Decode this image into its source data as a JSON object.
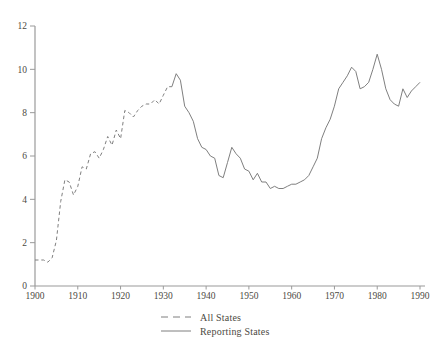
{
  "window": {
    "width": 444,
    "height": 350,
    "background": "#ffffff"
  },
  "colors": {
    "series_line": "#7f7f7f",
    "axis_line": "#9a9a9a",
    "tick_text": "#4c4a43"
  },
  "legend": {
    "position": "bottom-center",
    "items": [
      {
        "label": "All States",
        "line_style": "dashed"
      },
      {
        "label": "Reporting States",
        "line_style": "solid"
      }
    ]
  },
  "chart_data": {
    "type": "line",
    "title": "",
    "xlabel": "",
    "ylabel": "",
    "xlim": [
      1900,
      1990
    ],
    "ylim": [
      0,
      12
    ],
    "grid": false,
    "legend_position": "bottom-center",
    "x_tick_labels": [
      "1900",
      "1910",
      "1920",
      "1930",
      "1940",
      "1950",
      "1960",
      "1970",
      "1980",
      "1990"
    ],
    "y_tick_labels": [
      "0",
      "2",
      "4",
      "6",
      "8",
      "10",
      "12"
    ],
    "x_ticks": [
      1900,
      1910,
      1920,
      1930,
      1940,
      1950,
      1960,
      1970,
      1980,
      1990
    ],
    "y_ticks": [
      0,
      2,
      4,
      6,
      8,
      10,
      12
    ],
    "series": [
      {
        "name": "All States",
        "line_style": "dashed",
        "start_year": 1900,
        "end_year": 1932,
        "values": [
          1.2,
          1.2,
          1.2,
          1.1,
          1.3,
          2.1,
          3.9,
          4.9,
          4.8,
          4.2,
          4.6,
          5.5,
          5.4,
          6.1,
          6.2,
          5.9,
          6.3,
          6.9,
          6.5,
          7.2,
          6.8,
          8.1,
          8.0,
          7.8,
          8.1,
          8.3,
          8.4,
          8.4,
          8.6,
          8.4,
          8.8,
          9.2,
          9.2
        ]
      },
      {
        "name": "Reporting States",
        "line_style": "solid",
        "start_year": 1932,
        "end_year": 1990,
        "values": [
          9.2,
          9.8,
          9.5,
          8.3,
          8.0,
          7.6,
          6.8,
          6.4,
          6.3,
          6.0,
          5.9,
          5.1,
          5.0,
          5.7,
          6.4,
          6.1,
          5.9,
          5.4,
          5.3,
          4.9,
          5.2,
          4.8,
          4.8,
          4.5,
          4.6,
          4.5,
          4.5,
          4.6,
          4.7,
          4.7,
          4.8,
          4.9,
          5.1,
          5.5,
          5.9,
          6.8,
          7.3,
          7.7,
          8.3,
          9.1,
          9.4,
          9.7,
          10.1,
          9.9,
          9.1,
          9.2,
          9.4,
          10.0,
          10.7,
          10.0,
          9.1,
          8.6,
          8.4,
          8.3,
          9.1,
          8.7,
          9.0,
          9.2,
          9.4
        ]
      }
    ]
  }
}
